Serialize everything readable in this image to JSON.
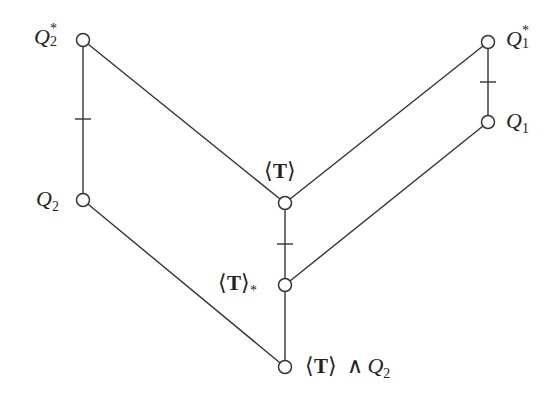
{
  "diagram": {
    "type": "hasse-diagram",
    "nodes": [
      {
        "id": "Q2star",
        "label_main": "Q",
        "label_sub": "2",
        "label_sup": "*",
        "x": 83,
        "y": 40
      },
      {
        "id": "Q2",
        "label_main": "Q",
        "label_sub": "2",
        "x": 83,
        "y": 200
      },
      {
        "id": "T",
        "label_main": "T",
        "x": 285,
        "y": 203
      },
      {
        "id": "Tstar",
        "label_main": "T",
        "label_sub": "*",
        "x": 285,
        "y": 285
      },
      {
        "id": "TmeetQ2",
        "label_main": "T",
        "label_op": "∧",
        "label_main2": "Q",
        "label_sub2": "2",
        "x": 285,
        "y": 367
      },
      {
        "id": "Q1star",
        "label_main": "Q",
        "label_sub": "1",
        "label_sup": "*",
        "x": 488,
        "y": 42
      },
      {
        "id": "Q1",
        "label_main": "Q",
        "label_sub": "1",
        "x": 488,
        "y": 122
      }
    ],
    "edges": [
      {
        "from": "Q2star",
        "to": "Q2",
        "tick": true
      },
      {
        "from": "Q2star",
        "to": "T",
        "tick": false
      },
      {
        "from": "Q1star",
        "to": "T",
        "tick": false
      },
      {
        "from": "Q1star",
        "to": "Q1",
        "tick": true
      },
      {
        "from": "T",
        "to": "Tstar",
        "tick": true
      },
      {
        "from": "Q1",
        "to": "Tstar",
        "tick": false
      },
      {
        "from": "Q2",
        "to": "TmeetQ2",
        "tick": false
      },
      {
        "from": "Tstar",
        "to": "TmeetQ2",
        "tick": false
      }
    ],
    "labels": {
      "q2star": {
        "main": "Q",
        "sub": "2",
        "sup": "*"
      },
      "q2": {
        "main": "Q",
        "sub": "2"
      },
      "t": {
        "open": "⟨",
        "main": "T",
        "close": "⟩"
      },
      "tstar": {
        "open": "⟨",
        "main": "T",
        "close": "⟩",
        "sub": "*"
      },
      "tmeet": {
        "open": "⟨",
        "main": "T",
        "close": "⟩",
        "op": "∧",
        "main2": "Q",
        "sub2": "2"
      },
      "q1star": {
        "main": "Q",
        "sub": "1",
        "sup": "*"
      },
      "q1": {
        "main": "Q",
        "sub": "1"
      }
    },
    "colors": {
      "line": "#333333",
      "node_fill": "#ffffff",
      "text": "#222222"
    }
  }
}
